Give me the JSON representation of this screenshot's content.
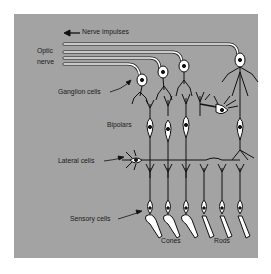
{
  "figure": {
    "background_color": "#a3a3a3",
    "cell_fill": "#ffffff",
    "stroke_color": "#111111"
  },
  "labels": {
    "nerve_impulses": "Nerve impulses",
    "optic_nerve_line1": "Optic",
    "optic_nerve_line2": "nerve",
    "ganglion_cells": "Ganglion cells",
    "bipolars": "Bipolars",
    "lateral_cells": "Lateral cells",
    "sensory_cells": "Sensory cells",
    "cones": "Cones",
    "rods": "Rods"
  },
  "icons": {
    "direction_arrow": "left-arrow-icon"
  }
}
